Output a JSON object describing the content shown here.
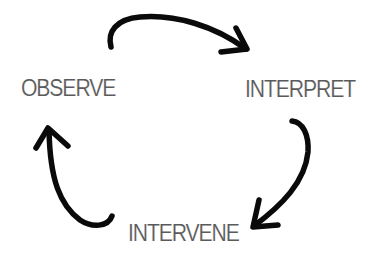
{
  "diagram": {
    "type": "cycle",
    "stages": [
      {
        "id": "observe",
        "label": "OBSERVE"
      },
      {
        "id": "interpret",
        "label": "INTERPRET"
      },
      {
        "id": "intervene",
        "label": "INTERVENE"
      }
    ],
    "arrows": [
      {
        "from": "OBSERVE",
        "to": "INTERPRET",
        "direction": "clockwise"
      },
      {
        "from": "INTERPRET",
        "to": "INTERVENE",
        "direction": "clockwise"
      },
      {
        "from": "INTERVENE",
        "to": "OBSERVE",
        "direction": "clockwise"
      }
    ],
    "colors": {
      "background": "#ffffff",
      "text": "#5a5a5a",
      "arrow": "#0a0a0a"
    }
  }
}
